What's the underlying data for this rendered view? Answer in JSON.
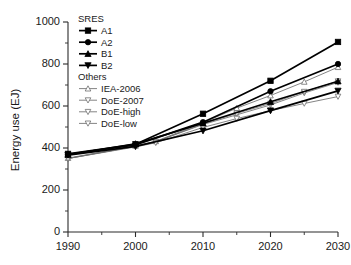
{
  "chart_data": {
    "type": "line",
    "title": "",
    "xlabel": "",
    "ylabel": "Energy use (EJ)",
    "xlim": [
      1990,
      2030
    ],
    "ylim": [
      0,
      1000
    ],
    "xticks": [
      1990,
      2000,
      2010,
      2020,
      2030
    ],
    "yticks": [
      0,
      200,
      400,
      600,
      800,
      1000
    ],
    "xminor_step": 5,
    "yminor_step": 100,
    "grid": false,
    "legend_position": "upper-left-inside",
    "legend_groups": [
      {
        "title": "SRES",
        "members": [
          "A1",
          "A2",
          "B1",
          "B2"
        ]
      },
      {
        "title": "Others",
        "members": [
          "IEA-2006",
          "DoE-2007",
          "DoE-high",
          "DoE-low"
        ]
      }
    ],
    "series": [
      {
        "name": "A1",
        "group": "SRES",
        "marker": "square",
        "marker_filled": true,
        "color": "#000000",
        "x": [
          1990,
          2000,
          2010,
          2020,
          2030
        ],
        "values": [
          372,
          418,
          563,
          720,
          905
        ]
      },
      {
        "name": "A2",
        "group": "SRES",
        "marker": "circle",
        "marker_filled": true,
        "color": "#000000",
        "x": [
          1990,
          2000,
          2010,
          2020,
          2030
        ],
        "values": [
          370,
          415,
          523,
          670,
          800
        ]
      },
      {
        "name": "B1",
        "group": "SRES",
        "marker": "triangle-up",
        "marker_filled": true,
        "color": "#000000",
        "x": [
          1990,
          2000,
          2010,
          2020,
          2030
        ],
        "values": [
          368,
          420,
          518,
          620,
          718
        ]
      },
      {
        "name": "B2",
        "group": "SRES",
        "marker": "triangle-down",
        "marker_filled": true,
        "color": "#000000",
        "x": [
          1990,
          2000,
          2010,
          2020,
          2030
        ],
        "values": [
          366,
          408,
          482,
          578,
          672
        ]
      },
      {
        "name": "IEA-2006",
        "group": "Others",
        "marker": "triangle-up",
        "marker_filled": false,
        "color": "#6e6e6e",
        "x": [
          1990,
          2000,
          2003,
          2010,
          2015,
          2020,
          2025,
          2030
        ],
        "values": [
          352,
          410,
          432,
          520,
          590,
          650,
          715,
          785
        ]
      },
      {
        "name": "DoE-2007",
        "group": "Others",
        "marker": "triangle-down",
        "marker_filled": false,
        "color": "#6e6e6e",
        "x": [
          1990,
          2000,
          2003,
          2010,
          2015,
          2020,
          2025,
          2030
        ],
        "values": [
          350,
          408,
          430,
          512,
          558,
          605,
          662,
          712
        ]
      },
      {
        "name": "DoE-high",
        "group": "Others",
        "marker": "triangle-down",
        "marker_filled": false,
        "color": "#6e6e6e",
        "x": [
          1990,
          2000,
          2003,
          2010,
          2015,
          2020,
          2025,
          2030
        ],
        "values": [
          350,
          408,
          430,
          515,
          565,
          612,
          668,
          718
        ]
      },
      {
        "name": "DoE-low",
        "group": "Others",
        "marker": "triangle-down",
        "marker_filled": false,
        "color": "#6e6e6e",
        "x": [
          1990,
          2000,
          2003,
          2010,
          2015,
          2020,
          2025,
          2030
        ],
        "values": [
          350,
          405,
          425,
          498,
          540,
          578,
          612,
          645
        ]
      }
    ]
  },
  "axes": {
    "y_title": "Energy use (EJ)",
    "y_tick_labels": [
      "0",
      "200",
      "400",
      "600",
      "800",
      "1000"
    ],
    "x_tick_labels": [
      "1990",
      "2000",
      "2010",
      "2020",
      "2030"
    ]
  },
  "legend": {
    "group1_title": "SRES",
    "group2_title": "Others",
    "items": [
      {
        "label": "A1"
      },
      {
        "label": "A2"
      },
      {
        "label": "B1"
      },
      {
        "label": "B2"
      },
      {
        "label": "IEA-2006"
      },
      {
        "label": "DoE-2007"
      },
      {
        "label": "DoE-high"
      },
      {
        "label": "DoE-low"
      }
    ]
  }
}
